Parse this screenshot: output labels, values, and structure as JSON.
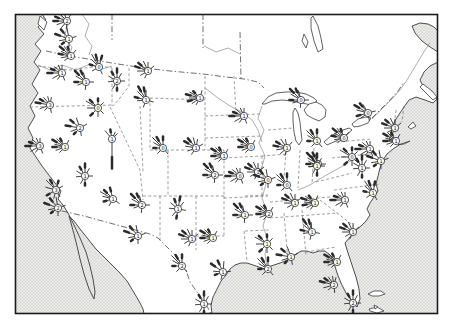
{
  "figure": {
    "kind": "scanned-textbook-map",
    "width": 450,
    "height": 328
  },
  "colors": {
    "paper": "#ffffff",
    "land": "#ffffff",
    "ink": "#2b2b2b",
    "coast": "#3a3a3a",
    "state_line": "#6a6a6a",
    "border_line": "#4a4a4a",
    "river": "#777777",
    "hatch_bg": "#f3f3f1",
    "hatch_line": "#bdbdbd",
    "hatch_line2": "#cccccc",
    "frame": "#1b1b1b"
  },
  "frame": {
    "x": 15.5,
    "y": 14.5,
    "w": 422,
    "h": 299,
    "stroke_width": 1.6
  },
  "hatch": {
    "size": 3.2,
    "stroke_width": 0.55
  },
  "water": [
    {
      "name": "pacific-ocean-hatch",
      "d": "M15,14 L42,14 L46,20 L38,27 L44,34 L35,44 L41,51 L34,62 L40,70 L32,84 L38,93 L30,106 L35,116 L28,128 L33,138 L30,148 L36,157 L42,166 L48,174 L55,183 L61,191 L58,199 L63,205 L68,213 L74,225 L80,238 L86,252 L90,266 L93,279 L95,292 L94,299 L89,289 L84,274 L80,259 L77,246 L74,234 L71,223 L69,216 L74,221 L80,229 L88,239 L96,249 L104,257 L112,265 L120,273 L127,281 L133,291 L139,301 L143,309 L144,314 L15,314 Z"
    },
    {
      "name": "atlantic-gulf-hatch",
      "d": "M438,62 L430,66 L424,72 L420,80 L424,88 L431,94 L437,99 L433,103 L425,100 L416,97 L409,100 L404,107 L400,113 L396,119 L393,125 L391,133 L389,141 L396,141 L399,145 L393,149 L387,154 L383,160 L380,168 L378,176 L376,184 L378,191 L374,197 L370,203 L367,209 L370,215 L366,221 L361,226 L355,231 L350,237 L345,243 L348,253 L352,265 L356,277 L359,289 L360,299 L357,307 L352,301 L346,293 L341,283 L337,273 L334,263 L330,255 L325,251 L319,251 L313,253 L307,251 L301,251 L295,255 L289,259 L283,262 L277,264 L271,266 L265,269 L259,267 L253,265 L247,263 L241,263 L235,265 L230,269 L226,275 L221,281 L217,289 L213,297 L211,305 L212,314 L438,314 Z"
    },
    {
      "name": "gulf-st-lawrence-hatch",
      "d": "M412,26 L420,23 L428,24 L434,27 L438,31 L438,52 L430,47 L422,41 L415,33 Z"
    }
  ],
  "islands": [
    {
      "name": "vancouver-island",
      "d": "M40,16 L47,22 L44,30 L38,24 Z"
    },
    {
      "name": "nova-scotia",
      "d": "M423,84 L432,91 L437,97 L433,100 L426,93 L420,87 Z"
    },
    {
      "name": "cape-cod",
      "d": "M408,127 L413,122 L416,126 L411,129 Z"
    },
    {
      "name": "long-island",
      "d": "M398,145 L404,143 L410,141 L404,144 Z"
    },
    {
      "name": "bahama-island",
      "d": "M368,294 L374,291 L381,291 L385,294 L379,296 L372,296 Z"
    },
    {
      "name": "cuba-edge",
      "d": "M369,309 L377,307 L384,311 L377,313 L370,311 Z"
    },
    {
      "name": "bahama-small",
      "d": "M374,305 L378,307 L375,309 Z"
    }
  ],
  "lakes": [
    {
      "name": "lake-superior",
      "d": "M262,104 L268,97 L276,93 L286,92 L296,92 L306,94 L314,98 L317,101 L311,105 L302,103 L292,101 L282,100 L272,101 L265,104 Z"
    },
    {
      "name": "lake-michigan",
      "d": "M295,108 L298,113 L300,122 L301,132 L302,140 L299,145 L296,141 L294,132 L293,121 L293,112 Z"
    },
    {
      "name": "lake-huron",
      "d": "M304,110 L309,104 L316,102 L322,105 L326,110 L325,117 L319,121 L312,118 L307,115 Z"
    },
    {
      "name": "lake-erie",
      "d": "M324,142 L331,136 L340,131 L349,128 L352,130 L345,136 L336,141 L327,145 Z"
    },
    {
      "name": "lake-ontario",
      "d": "M352,124 L358,119 L366,117 L371,118 L368,123 L360,126 L354,127 Z"
    },
    {
      "name": "lake-winnipeg",
      "d": "M313,16 L318,26 L321,38 L323,49 L318,52 L314,41 L311,28 L311,18 Z"
    },
    {
      "name": "lake-manitoba",
      "d": "M304,34 L308,42 L306,48 L302,41 Z"
    }
  ],
  "borders": [
    {
      "name": "us-canada-border",
      "d": "M46,51 L70,56 L94,60 L118,64 L144,68 L170,71 L203,74 L226,77 L244,79 L258,82 L264,88"
    },
    {
      "name": "ontario-border",
      "d": "M372,118 L381,109 L390,100 L398,91 L404,82"
    },
    {
      "name": "province-line-1",
      "d": "M112,14 L112,40"
    },
    {
      "name": "province-line-2",
      "d": "M203,14 L203,48"
    },
    {
      "name": "province-line-3",
      "d": "M240,32 L241,79"
    },
    {
      "name": "us-mexico-border",
      "d": "M62,211 L84,216 L106,222 L128,228 L150,234 L158,238 L166,246 L174,254 L181,262 L186,270 L190,282 L197,292 L203,300 L208,308 L211,314"
    }
  ],
  "state_lines": [
    "M38,66 L70,70 L100,66 L112,68",
    "M112,68 L112,106",
    "M30,107 L112,105",
    "M110,107 L140,170 L143,200",
    "M129,68 L129,86 L120,98 L113,106",
    "M150,98 L205,100",
    "M150,98 L150,150",
    "M205,76 L205,150",
    "M150,150 L224,150",
    "M224,150 L224,196",
    "M168,150 L168,196",
    "M140,106 L143,172",
    "M143,196 L224,196",
    "M160,196 L160,242",
    "M196,196 L196,250",
    "M224,196 L224,236",
    "M196,236 L224,236",
    "M224,158 L262,156",
    "M224,198 L268,196",
    "M205,116 L260,114",
    "M205,138 L262,136",
    "M234,76 L236,114",
    "M262,156 L262,196",
    "M262,156 L288,154",
    "M268,130 L293,128",
    "M286,152 L283,190",
    "M300,150 L298,188",
    "M314,148 L312,184",
    "M270,202 L342,196",
    "M270,218 L338,213",
    "M284,213 L288,262",
    "M302,210 L306,256",
    "M306,252 L336,247",
    "M334,190 L380,184",
    "M320,200 L354,226",
    "M332,158 L380,153",
    "M336,142 L372,139",
    "M316,182 L352,173",
    "M245,196 L268,195",
    "M245,231 L269,230",
    "M244,231 L247,262",
    "M396,110 L394,126",
    "M404,106 L402,122"
  ],
  "rivers": [
    "M262,106 L258,118 L264,130 L259,143 L265,156 L261,170 L266,184 L262,198 L267,212 L263,226 L268,240 L265,254 L267,267",
    "M205,88 L218,98 L230,106 L242,112 L252,120 L258,130 L262,142",
    "M352,160 L341,167 L330,173 L318,180 L308,186 L298,190",
    "M372,119 L382,109 L391,100 L400,90 L407,80 L413,70 L419,60 L425,50 L430,43",
    "M60,15 L68,25 L64,37 L72,47 L69,57",
    "M82,14 L89,24 L85,36 L92,46 L89,55",
    "M38,65 L50,70 L62,65 L76,70 L90,64 L102,69 L112,66",
    "M204,46 L216,52 L228,48 L240,54"
  ],
  "rose_style": {
    "circle_radius": 3.6,
    "ray_width": 0.9,
    "heavy_tip_width": 2.5,
    "digit_font_size": 5
  },
  "ray_templates": [
    [
      [
        300,
        11,
        1
      ],
      [
        315,
        8,
        0
      ],
      [
        330,
        6,
        1
      ],
      [
        285,
        7,
        0
      ],
      [
        270,
        9,
        1
      ],
      [
        250,
        6,
        0
      ],
      [
        225,
        4,
        0
      ],
      [
        30,
        4,
        0
      ]
    ],
    [
      [
        290,
        10,
        1
      ],
      [
        310,
        9,
        1
      ],
      [
        335,
        7,
        0
      ],
      [
        270,
        7,
        0
      ],
      [
        240,
        5,
        0
      ],
      [
        205,
        4,
        0
      ],
      [
        50,
        4,
        0
      ],
      [
        0,
        5,
        0
      ]
    ],
    [
      [
        0,
        8,
        1
      ],
      [
        330,
        9,
        1
      ],
      [
        300,
        7,
        0
      ],
      [
        315,
        11,
        0
      ],
      [
        270,
        6,
        1
      ],
      [
        225,
        4,
        0
      ],
      [
        140,
        4,
        0
      ]
    ],
    [
      [
        315,
        12,
        1
      ],
      [
        335,
        9,
        1
      ],
      [
        300,
        8,
        0
      ],
      [
        345,
        6,
        0
      ],
      [
        270,
        8,
        1
      ],
      [
        250,
        5,
        0
      ],
      [
        185,
        4,
        0
      ],
      [
        90,
        4,
        0
      ]
    ],
    [
      [
        270,
        11,
        1
      ],
      [
        290,
        8,
        1
      ],
      [
        310,
        6,
        0
      ],
      [
        335,
        5,
        0
      ],
      [
        240,
        7,
        0
      ],
      [
        215,
        4,
        0
      ],
      [
        0,
        4,
        0
      ],
      [
        160,
        4,
        0
      ]
    ],
    [
      [
        320,
        9,
        1
      ],
      [
        350,
        7,
        0
      ],
      [
        290,
        11,
        1
      ],
      [
        260,
        6,
        0
      ],
      [
        235,
        5,
        1
      ],
      [
        180,
        4,
        0
      ],
      [
        70,
        4,
        0
      ]
    ],
    [
      [
        0,
        9,
        1
      ],
      [
        30,
        5,
        0
      ],
      [
        330,
        7,
        1
      ],
      [
        300,
        6,
        0
      ],
      [
        265,
        5,
        0
      ],
      [
        210,
        5,
        0
      ],
      [
        180,
        6,
        1
      ],
      [
        90,
        4,
        0
      ]
    ],
    [
      [
        315,
        8,
        1
      ],
      [
        300,
        10,
        0
      ],
      [
        270,
        7,
        0
      ],
      [
        0,
        6,
        1
      ],
      [
        45,
        4,
        0
      ],
      [
        225,
        7,
        1
      ],
      [
        180,
        5,
        0
      ],
      [
        135,
        4,
        0
      ]
    ],
    [
      [
        180,
        26,
        1
      ],
      [
        350,
        6,
        1
      ],
      [
        320,
        7,
        0
      ],
      [
        25,
        4,
        0
      ],
      [
        45,
        4,
        0
      ]
    ]
  ],
  "roses": [
    [
      67,
      21,
      1,
      -20,
      "2"
    ],
    [
      69,
      39,
      5,
      0,
      "1"
    ],
    [
      71,
      56,
      0,
      10,
      "1"
    ],
    [
      62,
      73,
      4,
      0,
      "1"
    ],
    [
      86,
      82,
      3,
      0,
      "1"
    ],
    [
      99,
      67,
      2,
      15,
      "0"
    ],
    [
      117,
      81,
      6,
      0,
      "2"
    ],
    [
      148,
      71,
      1,
      0,
      "1"
    ],
    [
      200,
      98,
      0,
      -15,
      "1"
    ],
    [
      50,
      105,
      4,
      10,
      "3"
    ],
    [
      98,
      108,
      7,
      0,
      "0"
    ],
    [
      146,
      100,
      3,
      15,
      "1"
    ],
    [
      80,
      128,
      5,
      -10,
      "2"
    ],
    [
      40,
      146,
      4,
      0,
      "3"
    ],
    [
      65,
      147,
      0,
      0,
      "1"
    ],
    [
      112,
      139,
      8,
      0,
      "1"
    ],
    [
      163,
      148,
      2,
      0,
      "0"
    ],
    [
      196,
      148,
      1,
      10,
      "1"
    ],
    [
      224,
      156,
      0,
      0,
      "1"
    ],
    [
      215,
      175,
      3,
      0,
      "2"
    ],
    [
      240,
      176,
      4,
      0,
      "0"
    ],
    [
      258,
      172,
      1,
      0,
      "1"
    ],
    [
      56,
      190,
      7,
      15,
      "3"
    ],
    [
      58,
      208,
      5,
      0,
      "2"
    ],
    [
      85,
      176,
      6,
      0,
      "1"
    ],
    [
      113,
      199,
      2,
      -15,
      "1"
    ],
    [
      142,
      205,
      3,
      0,
      "2"
    ],
    [
      178,
      209,
      6,
      10,
      "1"
    ],
    [
      138,
      236,
      5,
      0,
      "1"
    ],
    [
      192,
      239,
      1,
      0,
      "1"
    ],
    [
      213,
      238,
      0,
      0,
      "1"
    ],
    [
      182,
      266,
      2,
      0,
      "2"
    ],
    [
      223,
      272,
      5,
      15,
      "1"
    ],
    [
      204,
      304,
      6,
      0,
      "1"
    ],
    [
      244,
      116,
      4,
      0,
      "1"
    ],
    [
      251,
      147,
      0,
      0,
      "0"
    ],
    [
      287,
      148,
      1,
      -10,
      "1"
    ],
    [
      301,
      100,
      3,
      0,
      "0"
    ],
    [
      317,
      141,
      2,
      0,
      "1"
    ],
    [
      344,
      138,
      0,
      10,
      "0"
    ],
    [
      370,
      149,
      4,
      0,
      "1"
    ],
    [
      368,
      113,
      3,
      -15,
      "0"
    ],
    [
      395,
      128,
      1,
      0,
      "1"
    ],
    [
      396,
      141,
      0,
      0,
      "1"
    ],
    [
      381,
      161,
      5,
      0,
      "1"
    ],
    [
      373,
      193,
      2,
      10,
      "1"
    ],
    [
      362,
      168,
      6,
      0,
      "1"
    ],
    [
      352,
      157,
      7,
      0,
      "0"
    ],
    [
      318,
      164,
      3,
      0,
      "0"
    ],
    [
      295,
      203,
      1,
      0,
      "1"
    ],
    [
      315,
      203,
      0,
      -10,
      "1"
    ],
    [
      345,
      200,
      4,
      0,
      "1"
    ],
    [
      268,
      180,
      5,
      0,
      "0"
    ],
    [
      287,
      185,
      2,
      0,
      "0"
    ],
    [
      317,
      166,
      6,
      0,
      "1"
    ],
    [
      269,
      214,
      0,
      0,
      "2"
    ],
    [
      312,
      232,
      3,
      10,
      "1"
    ],
    [
      353,
      232,
      1,
      0,
      "1"
    ],
    [
      267,
      244,
      7,
      0,
      "1"
    ],
    [
      291,
      257,
      5,
      -10,
      "1"
    ],
    [
      268,
      269,
      2,
      0,
      "2"
    ],
    [
      337,
      262,
      0,
      0,
      "1"
    ],
    [
      334,
      285,
      4,
      15,
      "2"
    ],
    [
      353,
      303,
      6,
      0,
      "2"
    ],
    [
      245,
      215,
      3,
      0,
      "1"
    ]
  ]
}
